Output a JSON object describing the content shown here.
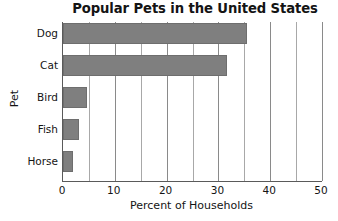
{
  "chart_data": {
    "type": "bar",
    "orientation": "horizontal",
    "title": "Popular Pets in the United States",
    "xlabel": "Percent of Households",
    "ylabel": "Pet",
    "categories": [
      "Dog",
      "Cat",
      "Bird",
      "Fish",
      "Horse"
    ],
    "values": [
      35.5,
      31.6,
      4.7,
      3.0,
      2.0
    ],
    "xlim": [
      0,
      50
    ],
    "xticks": [
      0,
      10,
      20,
      30,
      40,
      50
    ],
    "xtick_labels": [
      "0",
      "10",
      "20",
      "30",
      "40",
      "50"
    ],
    "minor_tick_step": 5,
    "grid": "vertical-only",
    "legend": "none",
    "bar_color": "#7f7f7f",
    "axis_color": "#5a5a5a",
    "gridline_color": "#9a9a9a",
    "background_color": "#ffffff"
  }
}
